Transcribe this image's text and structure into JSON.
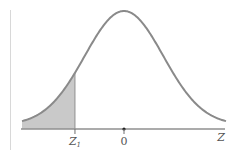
{
  "chart_data": {
    "type": "area",
    "title": "",
    "distribution": "standard normal",
    "xlabel": "Z",
    "ylabel": "",
    "tick_labels": [
      {
        "label": "Z",
        "subscript": "1",
        "position": "z1",
        "z": -1.25
      },
      {
        "label": "0",
        "subscript": "",
        "position": "mean",
        "z": 0
      }
    ],
    "axis_end_label": "Z",
    "shaded_region": {
      "from": "-inf",
      "to": "Z1",
      "side": "left tail"
    },
    "xlim": [
      -2.6,
      2.6
    ],
    "grid": false,
    "legend": null
  },
  "colors": {
    "curve": "#8a8a8a",
    "axis": "#8f8f8f",
    "shade": "#c9c9c9",
    "left_rule": "#d8d8d8",
    "label": "#555555",
    "marker": "#222222"
  }
}
